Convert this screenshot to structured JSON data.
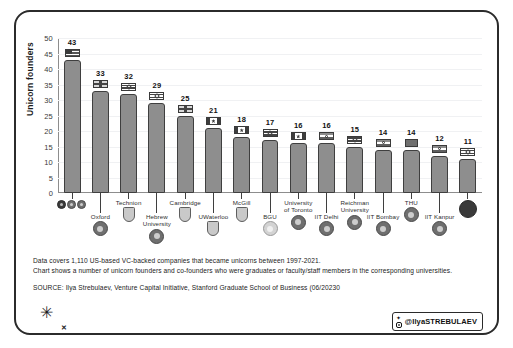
{
  "chart_data": {
    "type": "bar",
    "title": "",
    "xlabel": "",
    "ylabel": "Unicorn founders",
    "ylim": [
      0,
      50
    ],
    "ytick_step": 5,
    "yticks": [
      50,
      45,
      40,
      35,
      30,
      25,
      20,
      15,
      10,
      5,
      0
    ],
    "grid": true,
    "legend": "none",
    "categories": [
      "",
      "Oxford",
      "Technion",
      "Hebrew\nUniversity",
      "Cambridge",
      "UWaterloo",
      "McGill",
      "BGU",
      "University\nof Toronto",
      "IIT Delhi",
      "Reichman\nUniversity",
      "IIT Bombay",
      "THU",
      "IIT Kanpur",
      ""
    ],
    "values": [
      43,
      33,
      32,
      29,
      25,
      21,
      18,
      17,
      16,
      16,
      15,
      14,
      14,
      12,
      11
    ],
    "bar_color": "#8e8e8e",
    "bar_border_color": "#3f3f3f"
  },
  "axis": {
    "y_label": "Unicorn founders",
    "y_ticks": [
      "50",
      "45",
      "40",
      "35",
      "30",
      "25",
      "20",
      "15",
      "10",
      "5",
      "0"
    ]
  },
  "bars": [
    {
      "value": "43",
      "label": "",
      "emblem": "three-circles-logo",
      "flag": "us"
    },
    {
      "value": "33",
      "label": "Oxford",
      "emblem": "oxford-crest",
      "flag": "uk"
    },
    {
      "value": "32",
      "label": "Technion",
      "emblem": "technion-crest",
      "flag": "il"
    },
    {
      "value": "29",
      "label": "Hebrew\nUniversity",
      "emblem": "hebrew-university-crest",
      "flag": "il"
    },
    {
      "value": "25",
      "label": "Cambridge",
      "emblem": "cambridge-crest",
      "flag": "uk"
    },
    {
      "value": "21",
      "label": "UWaterloo",
      "emblem": "uwaterloo-crest",
      "flag": "ca"
    },
    {
      "value": "18",
      "label": "McGill",
      "emblem": "mcgill-crest",
      "flag": "ca"
    },
    {
      "value": "17",
      "label": "BGU",
      "emblem": "bgu-crest",
      "flag": "il"
    },
    {
      "value": "16",
      "label": "University\nof Toronto",
      "emblem": "toronto-crest",
      "flag": "ca"
    },
    {
      "value": "16",
      "label": "IIT Delhi",
      "emblem": "iit-delhi-crest",
      "flag": "in"
    },
    {
      "value": "15",
      "label": "Reichman\nUniversity",
      "emblem": "reichman-crest",
      "flag": "il"
    },
    {
      "value": "14",
      "label": "IIT Bombay",
      "emblem": "iit-bombay-crest",
      "flag": "in"
    },
    {
      "value": "14",
      "label": "THU",
      "emblem": "thu-crest",
      "flag": "cn"
    },
    {
      "value": "12",
      "label": "IIT Kanpur",
      "emblem": "iit-kanpur-crest",
      "flag": "in"
    },
    {
      "value": "11",
      "label": "",
      "emblem": "reichman-dark-logo",
      "flag": "il"
    }
  ],
  "notes": {
    "line1": "Data covers 1,110 US-based VC-backed companies that became unicorns between 1997-2021.",
    "line2": "Chart shows a number of unicorn founders and co-founders who were graduates or faculty/staff members in the corresponding universities.",
    "source": "SOURCE: Ilya Strebulaev, Venture Capital Initiative, Stanford Graduate School of Business (06/20230"
  },
  "branding": {
    "mark": "✳",
    "x_mark": "✕",
    "handle": "@IlyaSTREBULAEV"
  },
  "colors": {
    "bar": "#8e8e8e",
    "bar_border": "#3f3f3f",
    "grid": "#f0f1f3",
    "axis": "#8d8d8d",
    "text": "#222222",
    "frame": "#2b2b2b"
  }
}
